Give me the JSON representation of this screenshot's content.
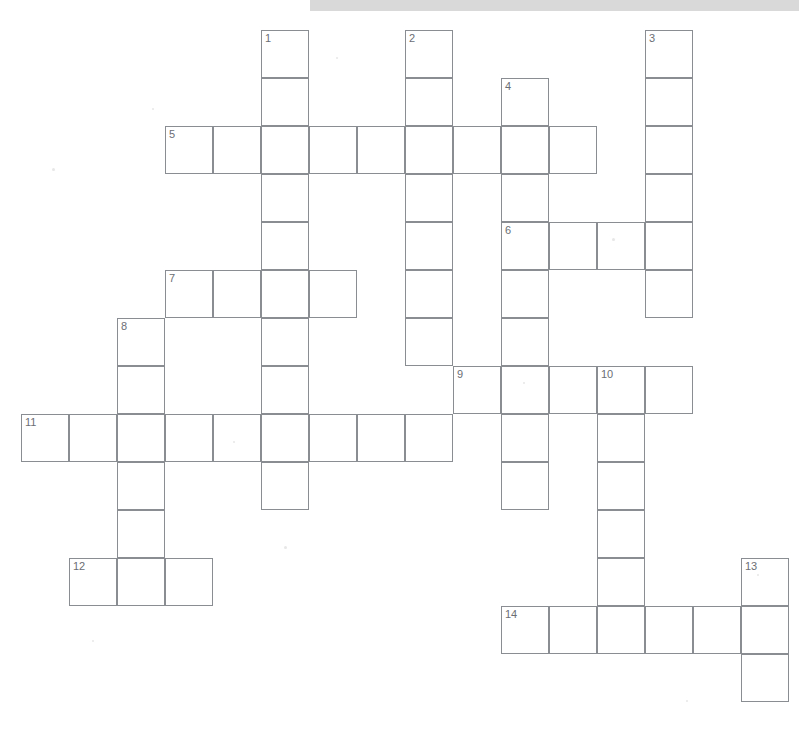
{
  "page": {
    "background_color": "#ffffff",
    "width": 799,
    "height": 729
  },
  "scan_bar": {
    "name": "scanner-edge-bar",
    "color": "#d9d9d9",
    "x": 310,
    "y": 0,
    "width": 489,
    "height": 11
  },
  "grid": {
    "cell_size": 48,
    "origin_x": 21,
    "origin_y": 30,
    "line_color": "#8a8d92",
    "cell_fill": "#ffffff",
    "number_color": "#6b6e74",
    "columns": 16,
    "rows": 14
  },
  "entries": [
    {
      "number": "1",
      "direction": "down",
      "row": 0,
      "col": 5,
      "length": 10
    },
    {
      "number": "2",
      "direction": "down",
      "row": 0,
      "col": 8,
      "length": 7
    },
    {
      "number": "3",
      "direction": "down",
      "row": 0,
      "col": 13,
      "length": 6
    },
    {
      "number": "4",
      "direction": "down",
      "row": 1,
      "col": 10,
      "length": 9
    },
    {
      "number": "5",
      "direction": "across",
      "row": 2,
      "col": 3,
      "length": 9
    },
    {
      "number": "6",
      "direction": "across",
      "row": 4,
      "col": 10,
      "length": 4
    },
    {
      "number": "7",
      "direction": "across",
      "row": 5,
      "col": 3,
      "length": 4
    },
    {
      "number": "8",
      "direction": "down",
      "row": 6,
      "col": 2,
      "length": 6
    },
    {
      "number": "9",
      "direction": "across",
      "row": 7,
      "col": 9,
      "length": 5
    },
    {
      "number": "10",
      "direction": "down",
      "row": 7,
      "col": 12,
      "length": 6
    },
    {
      "number": "11",
      "direction": "across",
      "row": 8,
      "col": 0,
      "length": 9
    },
    {
      "number": "12",
      "direction": "across",
      "row": 11,
      "col": 1,
      "length": 3
    },
    {
      "number": "13",
      "direction": "down",
      "row": 11,
      "col": 15,
      "length": 3
    },
    {
      "number": "14",
      "direction": "across",
      "row": 12,
      "col": 10,
      "length": 6
    }
  ],
  "numbered_cells": [
    {
      "number": "1",
      "row": 0,
      "col": 5
    },
    {
      "number": "2",
      "row": 0,
      "col": 8
    },
    {
      "number": "3",
      "row": 0,
      "col": 13
    },
    {
      "number": "4",
      "row": 1,
      "col": 10
    },
    {
      "number": "5",
      "row": 2,
      "col": 3
    },
    {
      "number": "6",
      "row": 4,
      "col": 10
    },
    {
      "number": "7",
      "row": 5,
      "col": 3
    },
    {
      "number": "8",
      "row": 6,
      "col": 2
    },
    {
      "number": "9",
      "row": 7,
      "col": 9
    },
    {
      "number": "10",
      "row": 7,
      "col": 12
    },
    {
      "number": "11",
      "row": 8,
      "col": 0
    },
    {
      "number": "12",
      "row": 11,
      "col": 1
    },
    {
      "number": "13",
      "row": 11,
      "col": 15
    },
    {
      "number": "14",
      "row": 12,
      "col": 10
    }
  ],
  "specks": [
    {
      "x": 52,
      "y": 168,
      "size": 3
    },
    {
      "x": 152,
      "y": 108,
      "size": 2
    },
    {
      "x": 336,
      "y": 57,
      "size": 2
    },
    {
      "x": 284,
      "y": 546,
      "size": 3
    },
    {
      "x": 612,
      "y": 238,
      "size": 3
    },
    {
      "x": 233,
      "y": 441,
      "size": 2
    },
    {
      "x": 523,
      "y": 382,
      "size": 2
    },
    {
      "x": 757,
      "y": 574,
      "size": 2
    },
    {
      "x": 92,
      "y": 640,
      "size": 2
    },
    {
      "x": 686,
      "y": 700,
      "size": 2
    }
  ]
}
